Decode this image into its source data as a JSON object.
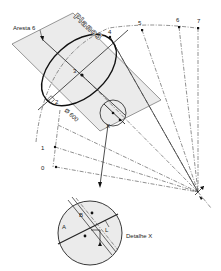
{
  "diagram": {
    "plane_label": "Plano3",
    "edge_label": "Aresta 6",
    "diameter_label": "Ø 600",
    "detail_marker": "X",
    "detail_title": "Detalhe X",
    "point_labels": [
      "0",
      "1",
      "2",
      "3",
      "4",
      "5",
      "6",
      "7"
    ],
    "detail_labels": {
      "a": "A",
      "b": "B",
      "l": "L"
    },
    "colors": {
      "plane_fill": "#ebebeb",
      "line": "#222222",
      "background": "#ffffff"
    }
  }
}
